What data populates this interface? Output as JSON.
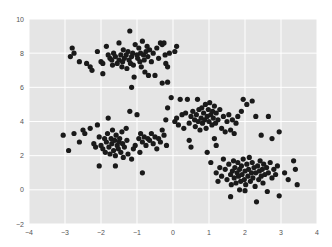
{
  "chart_data": {
    "type": "scatter",
    "title": "",
    "xlabel": "",
    "ylabel": "",
    "xlim": [
      -4,
      4
    ],
    "ylim": [
      -2,
      10
    ],
    "grid": true,
    "legend": null,
    "x_ticks": [
      -4,
      -3,
      -2,
      -1,
      0,
      1,
      2,
      3,
      4
    ],
    "y_ticks": [
      10,
      8,
      6,
      4,
      2,
      0,
      -2
    ],
    "style": {
      "background": "#eaeaf2",
      "plot_bg": "#e5e5e5",
      "grid_color": "#ffffff",
      "marker_color": "#1a1a1a",
      "marker_radius": 2.6
    },
    "series": [
      {
        "name": "cluster-top-left",
        "points": [
          [
            -2.8,
            8.3
          ],
          [
            -2.75,
            8.0
          ],
          [
            -2.85,
            7.8
          ],
          [
            -2.6,
            7.5
          ],
          [
            -2.4,
            7.4
          ],
          [
            -2.3,
            7.2
          ],
          [
            -2.25,
            7.0
          ],
          [
            -2.1,
            8.1
          ],
          [
            -2.0,
            7.5
          ],
          [
            -1.95,
            7.4
          ],
          [
            -1.95,
            6.8
          ],
          [
            -1.85,
            8.4
          ],
          [
            -1.8,
            7.9
          ],
          [
            -1.75,
            7.7
          ],
          [
            -1.7,
            7.6
          ],
          [
            -1.68,
            7.3
          ],
          [
            -1.65,
            8.0
          ],
          [
            -1.6,
            7.8
          ],
          [
            -1.55,
            7.4
          ],
          [
            -1.5,
            7.6
          ],
          [
            -1.5,
            8.6
          ],
          [
            -1.45,
            7.9
          ],
          [
            -1.42,
            7.2
          ],
          [
            -1.4,
            7.5
          ],
          [
            -1.38,
            8.2
          ],
          [
            -1.35,
            7.7
          ],
          [
            -1.3,
            7.9
          ],
          [
            -1.28,
            7.1
          ],
          [
            -1.25,
            8.1
          ],
          [
            -1.22,
            7.6
          ],
          [
            -1.2,
            9.3
          ],
          [
            -1.18,
            7.4
          ],
          [
            -1.15,
            7.8
          ],
          [
            -1.12,
            8.0
          ],
          [
            -1.1,
            7.3
          ],
          [
            -1.08,
            6.6
          ],
          [
            -1.05,
            8.5
          ],
          [
            -1.0,
            7.9
          ],
          [
            -0.98,
            7.7
          ],
          [
            -0.95,
            8.3
          ],
          [
            -0.92,
            7.5
          ],
          [
            -0.9,
            8.0
          ],
          [
            -0.88,
            7.2
          ],
          [
            -0.85,
            8.7
          ],
          [
            -0.82,
            7.9
          ],
          [
            -0.8,
            7.6
          ],
          [
            -0.78,
            6.9
          ],
          [
            -0.75,
            8.1
          ],
          [
            -0.72,
            8.4
          ],
          [
            -0.7,
            7.8
          ],
          [
            -0.68,
            6.7
          ],
          [
            -0.65,
            8.2
          ],
          [
            -0.6,
            7.5
          ],
          [
            -0.55,
            8.0
          ],
          [
            -0.5,
            6.7
          ],
          [
            -0.45,
            8.3
          ],
          [
            -0.4,
            7.7
          ],
          [
            -0.35,
            8.6
          ],
          [
            -0.3,
            8.5
          ],
          [
            -0.25,
            8.6
          ],
          [
            -0.22,
            7.9
          ],
          [
            -0.2,
            7.4
          ],
          [
            -0.15,
            7.2
          ],
          [
            -0.1,
            8.0
          ],
          [
            0.05,
            8.1
          ],
          [
            0.1,
            8.4
          ],
          [
            -1.15,
            6.0
          ],
          [
            -0.15,
            6.3
          ],
          [
            -0.3,
            6.25
          ]
        ]
      },
      {
        "name": "cluster-bottom-left",
        "points": [
          [
            -3.05,
            3.2
          ],
          [
            -2.9,
            2.3
          ],
          [
            -2.75,
            3.3
          ],
          [
            -2.6,
            2.8
          ],
          [
            -2.5,
            3.5
          ],
          [
            -2.45,
            3.3
          ],
          [
            -2.3,
            3.6
          ],
          [
            -2.2,
            2.7
          ],
          [
            -2.15,
            2.5
          ],
          [
            -2.1,
            3.8
          ],
          [
            -2.05,
            3.1
          ],
          [
            -2.0,
            2.6
          ],
          [
            -1.95,
            2.4
          ],
          [
            -1.9,
            3.0
          ],
          [
            -1.88,
            2.2
          ],
          [
            -1.85,
            2.8
          ],
          [
            -1.82,
            3.3
          ],
          [
            -1.8,
            4.2
          ],
          [
            -1.78,
            2.5
          ],
          [
            -1.75,
            2.1
          ],
          [
            -1.72,
            3.0
          ],
          [
            -1.7,
            2.7
          ],
          [
            -1.68,
            3.5
          ],
          [
            -1.65,
            2.3
          ],
          [
            -1.62,
            2.9
          ],
          [
            -1.6,
            2.0
          ],
          [
            -1.58,
            3.2
          ],
          [
            -1.55,
            2.6
          ],
          [
            -1.52,
            2.4
          ],
          [
            -1.5,
            2.8
          ],
          [
            -1.48,
            3.0
          ],
          [
            -1.45,
            2.2
          ],
          [
            -1.42,
            3.4
          ],
          [
            -1.4,
            2.7
          ],
          [
            -1.38,
            1.9
          ],
          [
            -1.35,
            2.5
          ],
          [
            -1.3,
            3.6
          ],
          [
            -1.28,
            2.9
          ],
          [
            -1.25,
            2.1
          ],
          [
            -1.2,
            4.6
          ],
          [
            -1.15,
            1.8
          ],
          [
            -1.1,
            2.4
          ],
          [
            -1.05,
            2.6
          ],
          [
            -1.0,
            4.4
          ],
          [
            -0.95,
            3.0
          ],
          [
            -0.92,
            2.2
          ],
          [
            -0.9,
            3.3
          ],
          [
            -0.85,
            2.8
          ],
          [
            -0.8,
            3.1
          ],
          [
            -0.75,
            2.6
          ],
          [
            -0.7,
            3.0
          ],
          [
            -0.65,
            2.9
          ],
          [
            -0.6,
            3.3
          ],
          [
            -0.55,
            2.7
          ],
          [
            -0.5,
            3.1
          ],
          [
            -0.45,
            2.4
          ],
          [
            -0.4,
            3.0
          ],
          [
            -0.35,
            2.8
          ],
          [
            -0.3,
            3.5
          ],
          [
            -0.25,
            3.2
          ],
          [
            -0.2,
            4.1
          ],
          [
            -0.15,
            4.8
          ],
          [
            -0.18,
            2.6
          ],
          [
            -1.6,
            1.4
          ],
          [
            -0.85,
            1.0
          ],
          [
            -2.05,
            1.4
          ]
        ]
      },
      {
        "name": "cluster-middle-right",
        "points": [
          [
            -0.05,
            5.4
          ],
          [
            0.05,
            4.0
          ],
          [
            0.1,
            4.2
          ],
          [
            0.15,
            3.8
          ],
          [
            0.2,
            5.3
          ],
          [
            0.25,
            4.4
          ],
          [
            0.3,
            3.6
          ],
          [
            0.35,
            4.5
          ],
          [
            0.4,
            5.3
          ],
          [
            0.45,
            3.9
          ],
          [
            0.5,
            4.3
          ],
          [
            0.55,
            4.6
          ],
          [
            0.6,
            4.1
          ],
          [
            0.62,
            3.7
          ],
          [
            0.65,
            4.4
          ],
          [
            0.68,
            5.3
          ],
          [
            0.7,
            4.0
          ],
          [
            0.72,
            4.7
          ],
          [
            0.75,
            3.5
          ],
          [
            0.78,
            4.2
          ],
          [
            0.8,
            4.8
          ],
          [
            0.82,
            3.9
          ],
          [
            0.85,
            4.5
          ],
          [
            0.88,
            4.1
          ],
          [
            0.9,
            5.0
          ],
          [
            0.92,
            3.6
          ],
          [
            0.95,
            4.3
          ],
          [
            0.98,
            4.7
          ],
          [
            1.0,
            4.0
          ],
          [
            1.02,
            5.1
          ],
          [
            1.05,
            4.4
          ],
          [
            1.08,
            3.8
          ],
          [
            1.1,
            4.6
          ],
          [
            1.12,
            4.2
          ],
          [
            1.15,
            4.9
          ],
          [
            1.18,
            3.9
          ],
          [
            1.2,
            4.5
          ],
          [
            1.25,
            4.1
          ],
          [
            1.3,
            4.7
          ],
          [
            1.35,
            3.6
          ],
          [
            1.4,
            4.3
          ],
          [
            1.45,
            3.4
          ],
          [
            1.5,
            4.0
          ],
          [
            1.55,
            4.4
          ],
          [
            1.6,
            3.5
          ],
          [
            1.65,
            4.1
          ],
          [
            1.7,
            3.3
          ],
          [
            1.75,
            3.9
          ],
          [
            1.8,
            4.3
          ],
          [
            1.9,
            4.6
          ],
          [
            1.95,
            5.3
          ],
          [
            2.05,
            5.0
          ],
          [
            2.2,
            5.2
          ],
          [
            2.3,
            4.3
          ],
          [
            2.45,
            3.2
          ],
          [
            2.65,
            4.3
          ],
          [
            2.75,
            3.0
          ],
          [
            2.95,
            3.4
          ],
          [
            0.45,
            2.9
          ],
          [
            0.5,
            2.5
          ],
          [
            1.15,
            3.0
          ],
          [
            1.2,
            2.6
          ]
        ]
      },
      {
        "name": "cluster-bottom-right",
        "points": [
          [
            0.95,
            2.2
          ],
          [
            1.05,
            1.6
          ],
          [
            1.2,
            1.0
          ],
          [
            1.25,
            0.5
          ],
          [
            1.3,
            1.3
          ],
          [
            1.35,
            0.8
          ],
          [
            1.4,
            1.8
          ],
          [
            1.45,
            1.2
          ],
          [
            1.5,
            0.6
          ],
          [
            1.55,
            1.5
          ],
          [
            1.6,
            0.9
          ],
          [
            1.62,
            0.3
          ],
          [
            1.65,
            1.1
          ],
          [
            1.68,
            1.7
          ],
          [
            1.7,
            0.7
          ],
          [
            1.72,
            1.3
          ],
          [
            1.75,
            0.4
          ],
          [
            1.78,
            1.0
          ],
          [
            1.8,
            1.6
          ],
          [
            1.82,
            0.8
          ],
          [
            1.85,
            1.2
          ],
          [
            1.88,
            0.5
          ],
          [
            1.9,
            1.4
          ],
          [
            1.92,
            0.9
          ],
          [
            1.95,
            1.8
          ],
          [
            1.98,
            0.6
          ],
          [
            2.0,
            1.1
          ],
          [
            2.02,
            0.3
          ],
          [
            2.05,
            1.5
          ],
          [
            2.08,
            0.8
          ],
          [
            2.1,
            1.2
          ],
          [
            2.12,
            1.9
          ],
          [
            2.15,
            0.5
          ],
          [
            2.18,
            1.0
          ],
          [
            2.2,
            1.6
          ],
          [
            2.22,
            0.7
          ],
          [
            2.25,
            1.3
          ],
          [
            2.28,
            0.2
          ],
          [
            2.3,
            1.0
          ],
          [
            2.32,
            -0.7
          ],
          [
            2.35,
            1.4
          ],
          [
            2.38,
            0.6
          ],
          [
            2.4,
            1.1
          ],
          [
            2.42,
            1.7
          ],
          [
            2.45,
            0.8
          ],
          [
            2.48,
            1.2
          ],
          [
            2.5,
            0.4
          ],
          [
            2.52,
            1.5
          ],
          [
            2.55,
            0.9
          ],
          [
            2.6,
            1.3
          ],
          [
            2.62,
            -0.1
          ],
          [
            2.65,
            1.0
          ],
          [
            2.7,
            1.6
          ],
          [
            2.75,
            0.7
          ],
          [
            2.8,
            1.2
          ],
          [
            2.85,
            0.9
          ],
          [
            2.9,
            1.4
          ],
          [
            2.95,
            -0.35
          ],
          [
            3.1,
            1.0
          ],
          [
            3.2,
            0.6
          ],
          [
            3.35,
            1.7
          ],
          [
            3.45,
            0.3
          ],
          [
            3.4,
            1.2
          ],
          [
            2.0,
            -0.05
          ],
          [
            1.85,
            0.0
          ],
          [
            1.6,
            -0.4
          ]
        ]
      }
    ]
  }
}
